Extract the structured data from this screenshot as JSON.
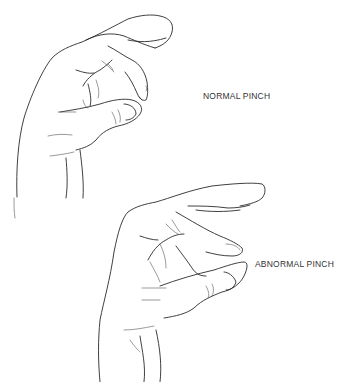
{
  "figure": {
    "panels": [
      {
        "id": "normal",
        "label": "NORMAL PINCH"
      },
      {
        "id": "abnormal",
        "label": "ABNORMAL PINCH"
      }
    ],
    "colors": {
      "line": "#2a2a2a",
      "background": "#ffffff"
    }
  }
}
